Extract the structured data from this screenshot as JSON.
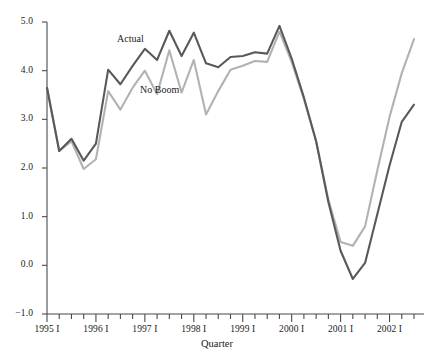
{
  "chart_data": {
    "type": "line",
    "title": "",
    "xlabel": "Quarter",
    "ylabel": "",
    "ylim": [
      -1.0,
      5.0
    ],
    "ytick_values": [
      -1.0,
      0.0,
      1.0,
      2.0,
      3.0,
      4.0,
      5.0
    ],
    "ytick_labels": [
      "−1.0",
      "0.0",
      "1.0",
      "2.0",
      "3.0",
      "4.0",
      "5.0"
    ],
    "grid": false,
    "legend_position": "inline-annotation",
    "x": [
      "1995 I",
      "1995 II",
      "1995 III",
      "1995 IV",
      "1996 I",
      "1996 II",
      "1996 III",
      "1996 IV",
      "1997 I",
      "1997 II",
      "1997 III",
      "1997 IV",
      "1998 I",
      "1998 II",
      "1998 III",
      "1998 IV",
      "1999 I",
      "1999 II",
      "1999 III",
      "1999 IV",
      "2000 I",
      "2000 II",
      "2000 III",
      "2000 IV",
      "2001 I",
      "2001 II",
      "2001 III",
      "2001 IV",
      "2002 I",
      "2002 II",
      "2002 III"
    ],
    "xtick_major_labels": [
      "1995 I",
      "1996 I",
      "1997 I",
      "1998 I",
      "1999 I",
      "2000 I",
      "2001 I",
      "2002 I"
    ],
    "xtick_major_indices": [
      0,
      4,
      8,
      12,
      16,
      20,
      24,
      28
    ],
    "series": [
      {
        "name": "Actual",
        "color": "#595959",
        "values": [
          3.65,
          2.35,
          2.6,
          2.15,
          2.5,
          4.02,
          3.72,
          4.1,
          4.45,
          4.22,
          4.82,
          4.3,
          4.78,
          4.15,
          4.07,
          4.28,
          4.3,
          4.38,
          4.35,
          4.92,
          4.25,
          3.45,
          2.55,
          1.3,
          0.3,
          -0.28,
          0.05,
          1.05,
          2.05,
          2.95,
          3.3
        ]
      },
      {
        "name": "No Boom",
        "color": "#b2b2b2",
        "values": [
          3.65,
          2.35,
          2.55,
          1.98,
          2.18,
          3.58,
          3.2,
          3.65,
          4.0,
          3.52,
          4.42,
          3.55,
          4.22,
          3.1,
          3.58,
          4.02,
          4.1,
          4.2,
          4.18,
          4.8,
          4.18,
          3.42,
          2.55,
          1.35,
          0.48,
          0.4,
          0.8,
          1.95,
          3.05,
          3.95,
          4.65
        ]
      }
    ],
    "annotations": [
      {
        "text": "Actual",
        "series": "Actual"
      },
      {
        "text": "No Boom",
        "series": "No Boom"
      }
    ]
  },
  "axis": {
    "x_title": "Quarter"
  }
}
